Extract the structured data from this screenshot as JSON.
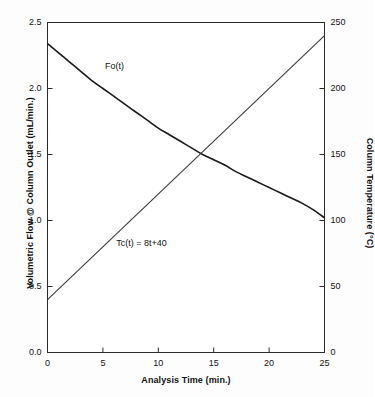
{
  "chart_data": {
    "type": "line",
    "title": "",
    "xlabel": "Analysis Time (min.)",
    "ylabel": "Volumetric Flow @ Column Outlet (mL/min.)",
    "ylabel_right": "Column Temperature (°C)",
    "xlim": [
      0,
      25
    ],
    "ylim": [
      0.0,
      2.5
    ],
    "ylim_right": [
      0,
      250
    ],
    "grid": false,
    "legend": "none",
    "xticks": [
      "0",
      "5",
      "10",
      "15",
      "20",
      "25"
    ],
    "xtick_values": [
      0,
      5,
      10,
      15,
      20,
      25
    ],
    "yticks_left": [
      "0.0",
      "0.5",
      "1.0",
      "1.5",
      "2.0",
      "2.5"
    ],
    "ytick_values_left": [
      0.0,
      0.5,
      1.0,
      1.5,
      2.0,
      2.5
    ],
    "yticks_right": [
      "0",
      "50",
      "100",
      "150",
      "200",
      "250"
    ],
    "ytick_values_right": [
      0,
      50,
      100,
      150,
      200,
      250
    ],
    "line_color": "#1a1a1a",
    "series": [
      {
        "name": "Fo(t)",
        "axis": "left",
        "annotation": "Fo(t)",
        "annotation_x": 5.2,
        "annotation_y": 2.16,
        "x": [
          0,
          1,
          2,
          3,
          4,
          5,
          6,
          7,
          8,
          9,
          10,
          11,
          12,
          13,
          14,
          15,
          16,
          17,
          18,
          19,
          20,
          21,
          22,
          23,
          24,
          25
        ],
        "values": [
          2.34,
          2.27,
          2.2,
          2.13,
          2.06,
          2.0,
          1.94,
          1.88,
          1.82,
          1.76,
          1.7,
          1.65,
          1.6,
          1.55,
          1.5,
          1.46,
          1.42,
          1.37,
          1.33,
          1.29,
          1.25,
          1.21,
          1.17,
          1.13,
          1.08,
          1.02
        ]
      },
      {
        "name": "Tc(t)",
        "axis": "right",
        "annotation": "Tc(t) = 8t+40",
        "annotation_x": 6.2,
        "annotation_y": 0.82,
        "x": [
          0,
          25
        ],
        "values": [
          40,
          240
        ],
        "values_left_scale": [
          0.4,
          2.4
        ]
      }
    ]
  },
  "axes": {
    "left_title": "Volumetric Flow @ Column Outlet (mL/min.)",
    "right_title": "Column Temperature (°C)",
    "bottom_title": "Analysis Time (min.)"
  }
}
